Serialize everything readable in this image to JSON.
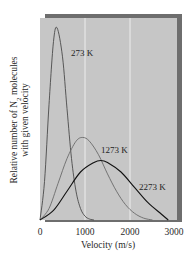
{
  "chart_data": {
    "type": "line",
    "title": "",
    "xlabel": "Velocity (m/s)",
    "ylabel_line1": "Relative number of N",
    "ylabel_sub": "2",
    "ylabel_line1_tail": " molecules",
    "ylabel_line2": "with given velocity",
    "xlim": [
      0,
      3000
    ],
    "ylim": [
      0,
      1
    ],
    "x_ticks": [
      0,
      1000,
      2000,
      3000
    ],
    "x_tick_labels": [
      "0",
      "1000",
      "2000",
      "3000"
    ],
    "grid": "vertical lines at 1000 and 2000",
    "legend": "inline labels",
    "series": [
      {
        "name": "273 K",
        "temperature_K": 273,
        "peak_velocity": 380,
        "peak_relative_height": 1.0,
        "color": "#4a4a4a",
        "x": [
          0,
          100,
          200,
          300,
          380,
          500,
          600,
          700,
          800,
          900,
          1000,
          1100,
          1200
        ],
        "values": [
          0,
          0.2,
          0.6,
          0.93,
          1.0,
          0.85,
          0.58,
          0.32,
          0.15,
          0.06,
          0.02,
          0.005,
          0
        ]
      },
      {
        "name": "1273 K",
        "temperature_K": 1273,
        "peak_velocity": 950,
        "peak_relative_height": 0.43,
        "color": "#6a6a6a",
        "x": [
          0,
          200,
          400,
          600,
          800,
          950,
          1100,
          1300,
          1500,
          1700,
          1900,
          2100,
          2300,
          2500
        ],
        "values": [
          0,
          0.06,
          0.19,
          0.32,
          0.41,
          0.43,
          0.41,
          0.34,
          0.24,
          0.15,
          0.08,
          0.035,
          0.01,
          0
        ]
      },
      {
        "name": "2273 K",
        "temperature_K": 2273,
        "peak_velocity": 1350,
        "peak_relative_height": 0.31,
        "color": "#111111",
        "x": [
          0,
          300,
          600,
          900,
          1200,
          1350,
          1500,
          1800,
          2100,
          2400,
          2700,
          2850
        ],
        "values": [
          0,
          0.05,
          0.15,
          0.25,
          0.3,
          0.31,
          0.3,
          0.25,
          0.17,
          0.09,
          0.03,
          0
        ]
      }
    ],
    "annotations": [
      {
        "text": "273 K",
        "near_x": 700,
        "near_y": 0.88
      },
      {
        "text": "1273 K",
        "near_x": 1330,
        "near_y": 0.42
      },
      {
        "text": "2273 K",
        "near_x": 2200,
        "near_y": 0.19
      }
    ]
  },
  "style": {
    "panel_color": "#c6c6c6",
    "shadow_color": "#6e6e6e",
    "gridline_color": "#f2f2f2",
    "text_color": "#2a2a2a"
  }
}
